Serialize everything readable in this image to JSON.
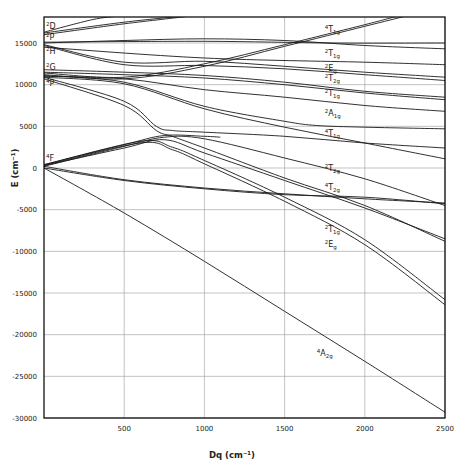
{
  "chart_data": {
    "type": "line",
    "title": "",
    "xlabel": "Dq (cm⁻¹)",
    "ylabel": "E (cm⁻¹)",
    "xlim": [
      0,
      2500
    ],
    "ylim": [
      -30000,
      18000
    ],
    "grid": true,
    "x_ticks": [
      500,
      1000,
      1500,
      2000,
      2500
    ],
    "x_tick_labels": [
      "500",
      "1000",
      "1500",
      "2000",
      "2500"
    ],
    "y_ticks": [
      15000,
      10000,
      5000,
      0,
      -5000,
      -10000,
      -15000,
      -20000,
      -25000,
      -30000
    ],
    "y_tick_labels": [
      "15000",
      "10000",
      "5000",
      "0",
      "-5000",
      "-10000",
      "-15000",
      "-20000",
      "-25000",
      "-30000"
    ],
    "free_ion_terms": [
      {
        "term": "2D",
        "mult": "2",
        "L": "D",
        "E": 16500
      },
      {
        "term": "2P",
        "mult": "2",
        "L": "P",
        "E": 15100
      },
      {
        "term": "2H",
        "mult": "2",
        "L": "H",
        "E": 14800
      },
      {
        "term": "2G",
        "mult": "2",
        "L": "G",
        "E": 11500
      },
      {
        "term": "4P",
        "mult": "4",
        "L": "P",
        "E": 10900
      },
      {
        "term": "4F",
        "mult": "4",
        "L": "F",
        "E": 600
      }
    ],
    "series": [
      {
        "name": "2D-a",
        "points": [
          [
            0,
            16300
          ],
          [
            300,
            17800
          ],
          [
            450,
            18200
          ]
        ]
      },
      {
        "name": "2D-b",
        "points": [
          [
            0,
            16000
          ],
          [
            500,
            17300
          ],
          [
            900,
            18200
          ]
        ]
      },
      {
        "name": "2D-c",
        "points": [
          [
            0,
            16200
          ],
          [
            500,
            17500
          ],
          [
            850,
            18200
          ]
        ]
      },
      {
        "name": "4T1g(P)",
        "label": "4T1g",
        "points": [
          [
            0,
            11400
          ],
          [
            500,
            10900
          ],
          [
            1000,
            12500
          ],
          [
            1500,
            14800
          ],
          [
            2000,
            17200
          ],
          [
            2200,
            18200
          ]
        ]
      },
      {
        "name": "4T1g(P)-b",
        "points": [
          [
            0,
            11200
          ],
          [
            500,
            10700
          ],
          [
            1000,
            12200
          ],
          [
            1500,
            14600
          ],
          [
            2000,
            17000
          ],
          [
            2250,
            18200
          ]
        ]
      },
      {
        "name": "2T1g-a",
        "label": "2T1g",
        "points": [
          [
            0,
            15000
          ],
          [
            500,
            15300
          ],
          [
            1000,
            15500
          ],
          [
            1500,
            15300
          ],
          [
            2000,
            14700
          ],
          [
            2500,
            14300
          ]
        ]
      },
      {
        "name": "2P-flat",
        "points": [
          [
            0,
            15100
          ],
          [
            1000,
            15200
          ],
          [
            1800,
            15000
          ],
          [
            2500,
            15000
          ]
        ]
      },
      {
        "name": "2H-b",
        "points": [
          [
            0,
            14700
          ],
          [
            500,
            12400
          ],
          [
            1000,
            12300
          ],
          [
            1500,
            11900
          ],
          [
            2000,
            11200
          ],
          [
            2500,
            10500
          ]
        ]
      },
      {
        "name": "2Eg",
        "label": "2Eg",
        "points": [
          [
            0,
            14800
          ],
          [
            500,
            12700
          ],
          [
            1000,
            12800
          ],
          [
            1500,
            12200
          ],
          [
            2000,
            11500
          ],
          [
            2500,
            10900
          ]
        ]
      },
      {
        "name": "2H-c",
        "points": [
          [
            0,
            14500
          ],
          [
            1000,
            13200
          ],
          [
            2000,
            12700
          ],
          [
            2500,
            12400
          ]
        ]
      },
      {
        "name": "2T2g-a",
        "label": "2T2g",
        "points": [
          [
            0,
            11800
          ],
          [
            500,
            11500
          ],
          [
            1000,
            11100
          ],
          [
            1500,
            10300
          ],
          [
            2000,
            9200
          ],
          [
            2500,
            8500
          ]
        ]
      },
      {
        "name": "2G-b",
        "points": [
          [
            0,
            11500
          ],
          [
            500,
            11200
          ],
          [
            1000,
            10800
          ],
          [
            1500,
            10000
          ],
          [
            2000,
            9000
          ],
          [
            2500,
            8200
          ]
        ]
      },
      {
        "name": "2T1g-b",
        "label": "2T1g",
        "points": [
          [
            0,
            11000
          ],
          [
            500,
            10700
          ],
          [
            1000,
            9400
          ],
          [
            1500,
            8500
          ],
          [
            2000,
            7500
          ],
          [
            2500,
            6800
          ]
        ]
      },
      {
        "name": "2A1g",
        "label": "2A1g",
        "points": [
          [
            0,
            11100
          ],
          [
            500,
            10300
          ],
          [
            1000,
            7400
          ],
          [
            1500,
            5600
          ],
          [
            1700,
            5100
          ],
          [
            2000,
            4900
          ],
          [
            2500,
            4700
          ]
        ]
      },
      {
        "name": "2G-c",
        "points": [
          [
            0,
            10900
          ],
          [
            500,
            10100
          ],
          [
            1000,
            7100
          ],
          [
            1500,
            4900
          ],
          [
            2000,
            3000
          ],
          [
            2500,
            1100
          ]
        ]
      },
      {
        "name": "4T1g(F)",
        "label": "4T1g",
        "points": [
          [
            0,
            10900
          ],
          [
            500,
            8000
          ],
          [
            700,
            5000
          ],
          [
            800,
            4500
          ],
          [
            1000,
            4300
          ],
          [
            1500,
            3800
          ],
          [
            2000,
            3000
          ],
          [
            2500,
            2400
          ]
        ]
      },
      {
        "name": "4P-lower",
        "points": [
          [
            0,
            10700
          ],
          [
            500,
            7500
          ],
          [
            700,
            4500
          ],
          [
            800,
            3800
          ],
          [
            1000,
            2400
          ],
          [
            1500,
            -1200
          ],
          [
            2000,
            -4500
          ],
          [
            2500,
            -8800
          ]
        ]
      },
      {
        "name": "4F-rise-a",
        "points": [
          [
            0,
            200
          ],
          [
            500,
            2600
          ],
          [
            750,
            3700
          ],
          [
            1000,
            3500
          ],
          [
            1500,
            1200
          ],
          [
            2000,
            -1300
          ],
          [
            2500,
            -4500
          ]
        ]
      },
      {
        "name": "4F-rise-b",
        "points": [
          [
            0,
            400
          ],
          [
            500,
            2800
          ],
          [
            750,
            3900
          ],
          [
            1000,
            3800
          ],
          [
            1100,
            3700
          ]
        ]
      },
      {
        "name": "2T2g-b",
        "label": "2T2g",
        "points": [
          [
            0,
            300
          ],
          [
            500,
            2400
          ],
          [
            750,
            3400
          ],
          [
            1000,
            1800
          ],
          [
            1500,
            -1500
          ],
          [
            2000,
            -4800
          ],
          [
            2500,
            -8500
          ]
        ]
      },
      {
        "name": "4T2g",
        "label": "4T2g",
        "points": [
          [
            0,
            200
          ],
          [
            500,
            -1400
          ],
          [
            1000,
            -2400
          ],
          [
            1500,
            -3100
          ],
          [
            2000,
            -3700
          ],
          [
            2500,
            -4200
          ]
        ]
      },
      {
        "name": "4T2g-b",
        "points": [
          [
            0,
            0
          ],
          [
            500,
            -1500
          ],
          [
            1000,
            -2500
          ],
          [
            1500,
            -3200
          ],
          [
            2000,
            -3500
          ],
          [
            2500,
            -4300
          ]
        ]
      },
      {
        "name": "2T1g-c",
        "label": "2T1g",
        "points": [
          [
            0,
            400
          ],
          [
            600,
            3200
          ],
          [
            800,
            2500
          ],
          [
            1000,
            900
          ],
          [
            1500,
            -3500
          ],
          [
            2000,
            -8600
          ],
          [
            2500,
            -15800
          ]
        ]
      },
      {
        "name": "2Eg-b",
        "label": "2Eg",
        "points": [
          [
            0,
            300
          ],
          [
            600,
            3000
          ],
          [
            800,
            2200
          ],
          [
            1000,
            500
          ],
          [
            1500,
            -4000
          ],
          [
            2000,
            -9200
          ],
          [
            2500,
            -16400
          ]
        ]
      },
      {
        "name": "4A2g",
        "label": "4A2g",
        "points": [
          [
            0,
            0
          ],
          [
            500,
            -5400
          ],
          [
            1000,
            -11200
          ],
          [
            1500,
            -17200
          ],
          [
            2000,
            -23200
          ],
          [
            2500,
            -29300
          ]
        ]
      }
    ],
    "level_labels": [
      {
        "text": "4T1g",
        "mult": "4",
        "main": "T",
        "sub": "1g",
        "Dq": 1750,
        "E": 16300
      },
      {
        "text": "2T1g",
        "mult": "2",
        "main": "T",
        "sub": "1g",
        "Dq": 1750,
        "E": 13400
      },
      {
        "text": "2Eg",
        "mult": "2",
        "main": "E",
        "sub": "g",
        "Dq": 1750,
        "E": 11700
      },
      {
        "text": "2T2g",
        "mult": "2",
        "main": "T",
        "sub": "2g",
        "Dq": 1750,
        "E": 10400
      },
      {
        "text": "2T1g",
        "mult": "2",
        "main": "T",
        "sub": "1g",
        "Dq": 1750,
        "E": 8700
      },
      {
        "text": "2A1g",
        "mult": "2",
        "main": "A",
        "sub": "1g",
        "Dq": 1750,
        "E": 6300
      },
      {
        "text": "4T1g",
        "mult": "4",
        "main": "T",
        "sub": "1g",
        "Dq": 1750,
        "E": 3800
      },
      {
        "text": "2T2g",
        "mult": "2",
        "main": "T",
        "sub": "2g",
        "Dq": 1750,
        "E": -400
      },
      {
        "text": "4T2g",
        "mult": "4",
        "main": "T",
        "sub": "2g",
        "Dq": 1750,
        "E": -2600
      },
      {
        "text": "2T1g",
        "mult": "2",
        "main": "T",
        "sub": "1g",
        "Dq": 1750,
        "E": -7700
      },
      {
        "text": "2Eg",
        "mult": "2",
        "main": "E",
        "sub": "g",
        "Dq": 1750,
        "E": -9500
      },
      {
        "text": "4A2g",
        "mult": "4",
        "main": "A",
        "sub": "2g",
        "Dq": 1700,
        "E": -22500
      }
    ]
  },
  "axes": {
    "x_label": "Dq (cm⁻¹)",
    "y_label": "E (cm⁻¹)"
  }
}
